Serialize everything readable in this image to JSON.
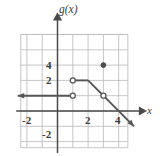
{
  "figure": {
    "kind": "coordinate-grid-graph",
    "width": 160,
    "height": 156,
    "background_color": "#ffffff"
  },
  "axes": {
    "y_axis_label": "g(x)",
    "x_axis_label": "x",
    "axis_color": "#4a4a4a",
    "grid_color": "#b9b9b9",
    "curve_color": "#555555",
    "x_ticks": [
      {
        "value": -2,
        "label": "-2"
      },
      {
        "value": 2,
        "label": "2"
      },
      {
        "value": 4,
        "label": "4"
      }
    ],
    "y_ticks": [
      {
        "value": 4,
        "label": "4"
      },
      {
        "value": 2,
        "label": "2"
      },
      {
        "value": -2,
        "label": "-2"
      }
    ]
  },
  "chart_data": {
    "type": "line",
    "title": "",
    "xlabel": "x",
    "ylabel": "g(x)",
    "xlim": [
      -2.4,
      4.6
    ],
    "ylim": [
      -2.4,
      5.0
    ],
    "grid": true,
    "legend": "none",
    "x_ticks": [
      -2,
      2,
      4
    ],
    "y_ticks": [
      4,
      2,
      -2
    ],
    "tick_step": 1,
    "series": [
      {
        "name": "left-ray",
        "description": "horizontal ray at g(x)=1 extending to negative infinity",
        "type": "ray",
        "points": [
          [
            -2.6,
            1
          ],
          [
            1,
            1
          ]
        ],
        "arrow_at": "start",
        "endpoint_open": [
          [
            1,
            1
          ]
        ]
      },
      {
        "name": "middle-segment",
        "description": "horizontal segment at g(x)=2 from x=1 to x=2",
        "type": "segment",
        "points": [
          [
            1,
            2
          ],
          [
            2,
            2
          ]
        ],
        "endpoint_open": [
          [
            1,
            2
          ]
        ]
      },
      {
        "name": "descending-ray",
        "description": "line of slope -1 from (2,2) through (3,1) continuing down-right",
        "type": "ray",
        "points": [
          [
            2,
            2
          ],
          [
            5.0,
            -1.0
          ]
        ],
        "arrow_at": "end",
        "endpoint_open": [
          [
            3,
            1
          ]
        ]
      }
    ],
    "open_points": [
      {
        "x": 1,
        "y": 2
      },
      {
        "x": 1,
        "y": 1
      },
      {
        "x": 3,
        "y": 1
      }
    ],
    "closed_points": [
      {
        "x": 3,
        "y": 3
      }
    ]
  }
}
